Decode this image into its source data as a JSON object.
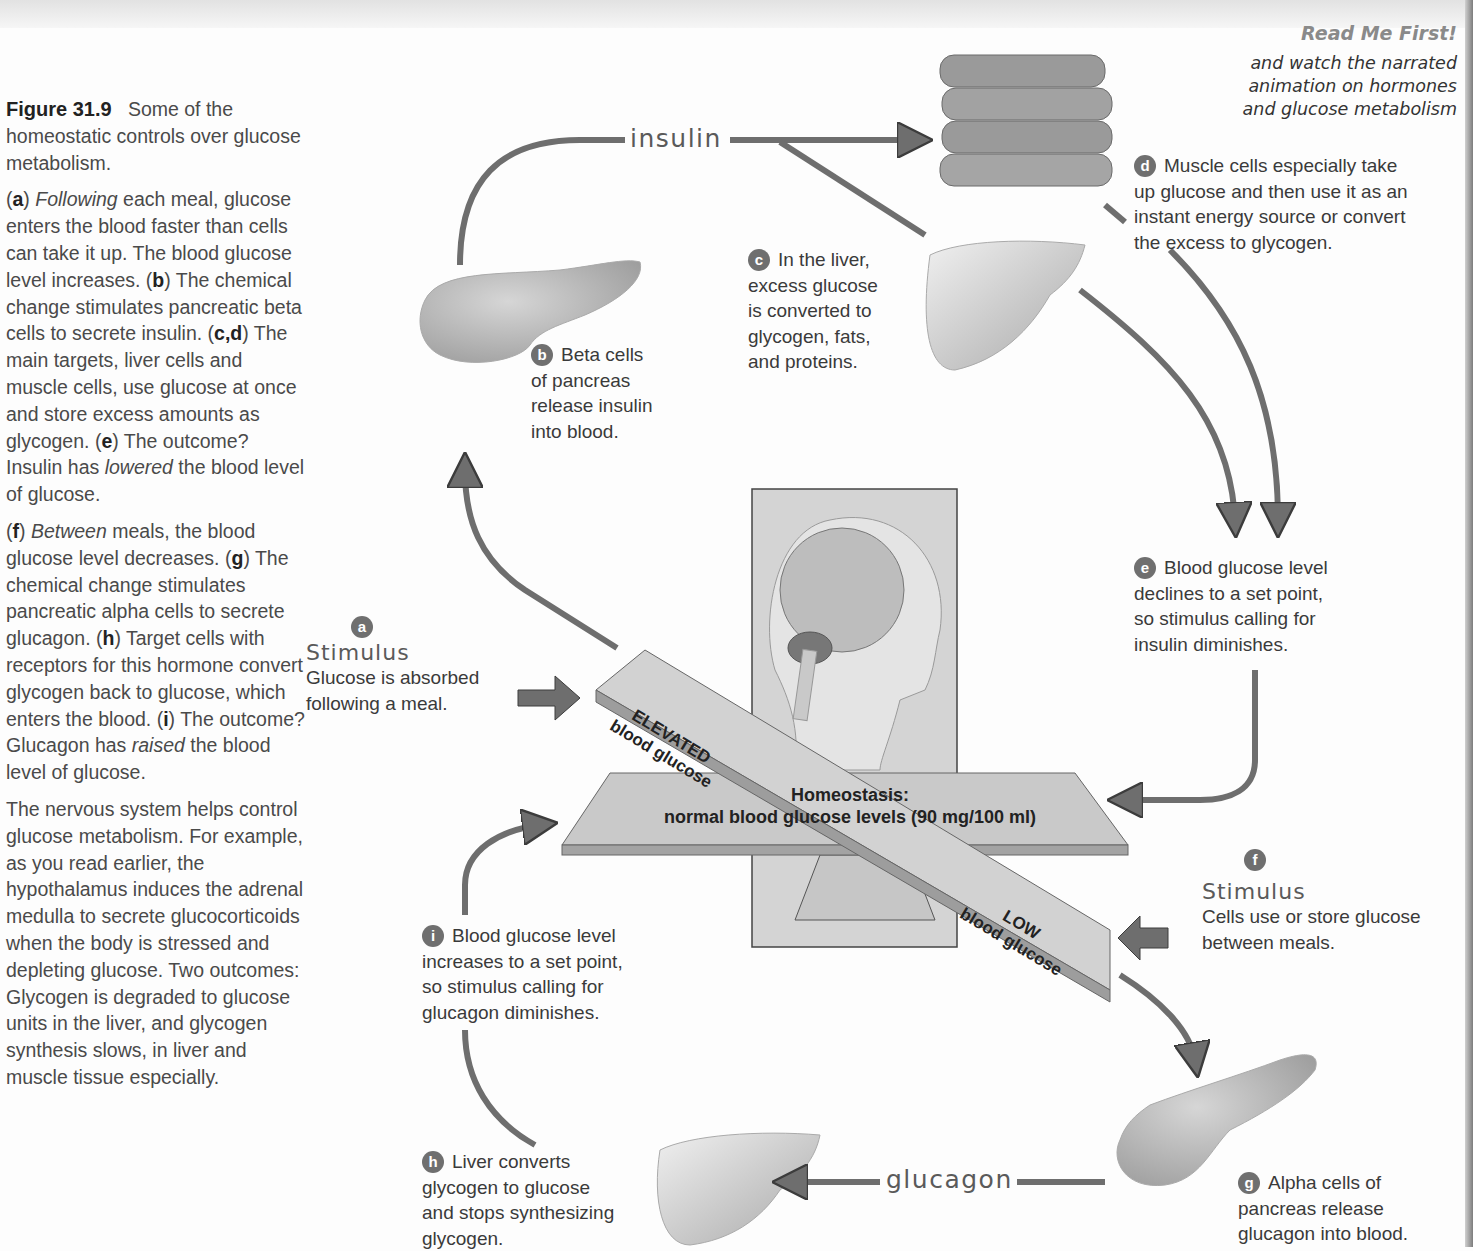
{
  "caption": {
    "figure_label": "Figure 31.9",
    "figure_title": "Some of the homeostatic controls over glucose metabolism.",
    "para1": [
      {
        "tag": "a",
        "lead_italic": "Following",
        "text": " each meal, glucose enters the blood faster than cells can take it up. The blood glucose level increases. "
      },
      {
        "tag": "b",
        "text": " The chemical change stimulates pancreatic beta cells to secrete insulin. "
      },
      {
        "tag": "c,d",
        "text": " The main targets, liver cells and muscle cells, use glucose at once and store excess amounts as glycogen. "
      },
      {
        "tag": "e",
        "text": " The outcome? Insulin has ",
        "italic": "lowered",
        "tail": " the blood level of glucose."
      }
    ],
    "para2": [
      {
        "tag": "f",
        "lead_italic": "Between",
        "text": " meals, the blood glucose level decreases. "
      },
      {
        "tag": "g",
        "text": " The chemical change stimulates pancreatic alpha cells to secrete glucagon. "
      },
      {
        "tag": "h",
        "text": " Target cells with receptors for this hormone convert glycogen back to glucose, which enters the blood. "
      },
      {
        "tag": "i",
        "text": " The outcome? Glucagon has ",
        "italic": "raised",
        "tail": " the blood level of glucose."
      }
    ],
    "para3": "The nervous system helps control glucose metabolism. For example, as you read earlier, the hypothalamus induces the adrenal medulla to secrete glucocorticoids when the body is stressed and depleting glucose. Two outcomes: Glycogen is degraded to glucose units in the liver, and glycogen synthesis slows, in liver and muscle tissue especially."
  },
  "readme": {
    "title": "Read Me First!",
    "line1": "and watch the narrated",
    "line2": "animation on hormones",
    "line3": "and glucose metabolism"
  },
  "hormones": {
    "insulin": "insulin",
    "glucagon": "glucagon"
  },
  "steps": {
    "a": {
      "badge": "a",
      "title": "Stimulus",
      "text1": "Glucose is absorbed",
      "text2": "following a meal."
    },
    "b": {
      "badge": "b",
      "lines": [
        "Beta cells",
        "of pancreas",
        "release insulin",
        "into blood."
      ]
    },
    "c": {
      "badge": "c",
      "lines": [
        "In the liver,",
        "excess glucose",
        "is converted to",
        "glycogen, fats,",
        "and proteins."
      ]
    },
    "d": {
      "badge": "d",
      "lines": [
        "Muscle cells especially take",
        "up glucose and then use it as an",
        "instant energy source or convert",
        "the excess to glycogen."
      ]
    },
    "e": {
      "badge": "e",
      "lines": [
        "Blood glucose level",
        "declines to a set point,",
        "so stimulus calling for",
        "insulin diminishes."
      ]
    },
    "f": {
      "badge": "f",
      "title": "Stimulus",
      "text1": "Cells use or store glucose",
      "text2": "between meals."
    },
    "g": {
      "badge": "g",
      "lines": [
        "Alpha cells of",
        "pancreas release",
        "glucagon into blood."
      ]
    },
    "h": {
      "badge": "h",
      "lines": [
        "Liver converts",
        "glycogen to glucose",
        "and stops synthesizing",
        "glycogen."
      ]
    },
    "i": {
      "badge": "i",
      "lines": [
        "Blood glucose level",
        "increases to a set point,",
        "so stimulus calling for",
        "glucagon diminishes."
      ]
    }
  },
  "balance": {
    "homeostasis_title": "Homeostasis:",
    "homeostasis_text": "normal blood glucose levels (90 mg/100 ml)",
    "elevated_1": "ELEVATED",
    "elevated_2": "blood glucose",
    "low_1": "LOW",
    "low_2": "blood glucose"
  },
  "colors": {
    "arrow": "#6e6e6e",
    "arrow_stroke": "#3c3c3c",
    "organ": "#b9b9b9",
    "panel": "#d4d4d4"
  }
}
